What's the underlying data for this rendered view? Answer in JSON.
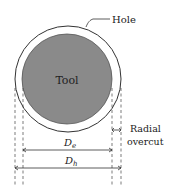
{
  "diagram": {
    "labels": {
      "hole": "Hole",
      "tool": "Tool",
      "de_main": "D",
      "de_sub": "e",
      "dh_main": "D",
      "dh_sub": "h",
      "radial_line1": "Radial",
      "radial_line2": "overcut"
    },
    "colors": {
      "tool_fill": "#8a8a8a",
      "stroke": "#222222",
      "background": "#ffffff"
    }
  }
}
